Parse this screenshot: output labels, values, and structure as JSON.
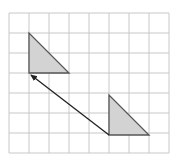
{
  "diagram": {
    "type": "grid-translation",
    "colors": {
      "background": "#ffffff",
      "grid": "#c8c8c8",
      "shape_fill": "#d3d3d3",
      "shape_stroke": "#555555",
      "arrow": "#222222"
    },
    "grid": {
      "x0": 9,
      "y0": 13,
      "cell": 20,
      "cols": 8,
      "rows": 7
    },
    "shapes": [
      {
        "name": "image-triangle",
        "points": "29,33 29,73 69,73"
      },
      {
        "name": "original-triangle",
        "points": "109,95 109,135 149,135"
      }
    ],
    "arrow": {
      "x1": 109,
      "y1": 135,
      "x2": 31,
      "y2": 75
    }
  }
}
